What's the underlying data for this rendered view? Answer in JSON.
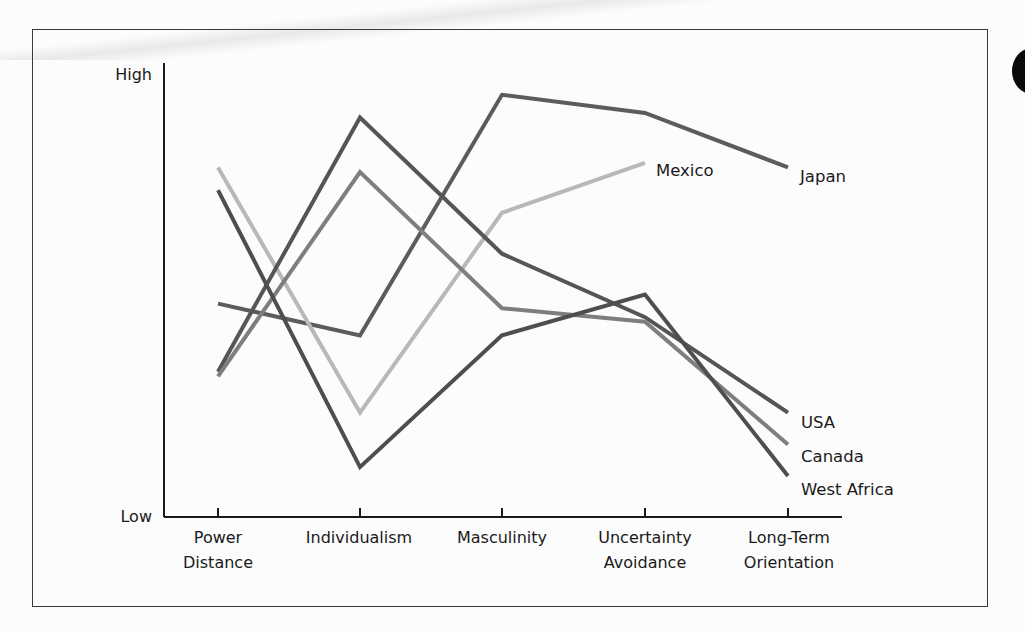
{
  "chart_data": {
    "type": "line",
    "title": "",
    "xlabel": "",
    "ylabel": "",
    "y_axis_labels": {
      "high": "High",
      "low": "Low"
    },
    "ylim": [
      0,
      100
    ],
    "grid": false,
    "legend_position": "inline labels at line ends",
    "categories": [
      [
        "Power",
        "Distance"
      ],
      [
        "Individualism"
      ],
      [
        "Masculinity"
      ],
      [
        "Uncertainty",
        "Avoidance"
      ],
      [
        "Long-Term",
        "Orientation"
      ]
    ],
    "category_names": [
      "Power Distance",
      "Individualism",
      "Masculinity",
      "Uncertainty Avoidance",
      "Long-Term Orientation"
    ],
    "series": [
      {
        "name": "Japan",
        "values": [
          47,
          40,
          93,
          89,
          77
        ],
        "color": "#5c5c5c",
        "label_pos": [
          800,
          182
        ]
      },
      {
        "name": "Mexico",
        "values": [
          77,
          23,
          67,
          78,
          null
        ],
        "color": "#b8b8b8",
        "label_pos": [
          656,
          175
        ]
      },
      {
        "name": "USA",
        "values": [
          32,
          88,
          58,
          44,
          23
        ],
        "color": "#555555",
        "label_pos": [
          801,
          428
        ]
      },
      {
        "name": "Canada",
        "values": [
          31,
          76,
          46,
          43,
          16
        ],
        "color": "#7e7e7e",
        "label_pos": [
          801,
          462
        ]
      },
      {
        "name": "West Africa",
        "values": [
          72,
          11,
          40,
          49,
          9
        ],
        "color": "#4e4e4e",
        "label_pos": [
          801,
          495
        ]
      }
    ]
  },
  "axis": {
    "high_label": "High",
    "low_label": "Low"
  },
  "labels": {
    "x0a": "Power",
    "x0b": "Distance",
    "x1": "Individualism",
    "x2": "Masculinity",
    "x3a": "Uncertainty",
    "x3b": "Avoidance",
    "x4a": "Long-Term",
    "x4b": "Orientation",
    "japan": "Japan",
    "mexico": "Mexico",
    "usa": "USA",
    "canada": "Canada",
    "west_africa": "West Africa"
  }
}
